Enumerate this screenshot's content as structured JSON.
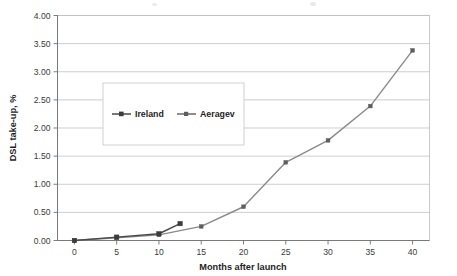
{
  "chart_data": {
    "type": "line",
    "title": "",
    "xlabel": "Months after launch",
    "ylabel": "DSL take-up, %",
    "xlim": [
      -2,
      42
    ],
    "ylim": [
      0.0,
      4.0
    ],
    "xticks": [
      0,
      5,
      10,
      15,
      20,
      25,
      30,
      35,
      40
    ],
    "xtick_labels": [
      "0",
      "5",
      "10",
      "15",
      "20",
      "25",
      "30",
      "35",
      "40"
    ],
    "yticks": [
      0.0,
      0.5,
      1.0,
      1.5,
      2.0,
      2.5,
      3.0,
      3.5,
      4.0
    ],
    "ytick_labels": [
      "0.00",
      "0.50",
      "1.00",
      "1.50",
      "2.00",
      "2.50",
      "3.00",
      "3.50",
      "4.00"
    ],
    "grid": "horizontal",
    "legend_position": "upper-left-inset",
    "series": [
      {
        "name": "Ireland",
        "marker": "square",
        "color": "#3c3c3c",
        "x": [
          0,
          5,
          10,
          12.5
        ],
        "values": [
          0.0,
          0.06,
          0.12,
          0.3
        ]
      },
      {
        "name": "Aeragev",
        "marker": "square",
        "color": "#5d5d5d",
        "x": [
          0,
          5,
          10,
          15,
          20,
          25,
          30,
          35,
          40
        ],
        "values": [
          0.0,
          0.05,
          0.1,
          0.25,
          0.6,
          1.39,
          1.78,
          2.39,
          3.38
        ]
      }
    ]
  },
  "legend": {
    "entries": [
      {
        "label": "Ireland"
      },
      {
        "label": "Aeragev"
      }
    ]
  },
  "colors": {
    "gridline": "#b9b9b9",
    "axis": "#6f6f6f",
    "series_ireland": "#3c3c3c",
    "series_average": "#5d5d5d",
    "background": "#ffffff"
  }
}
